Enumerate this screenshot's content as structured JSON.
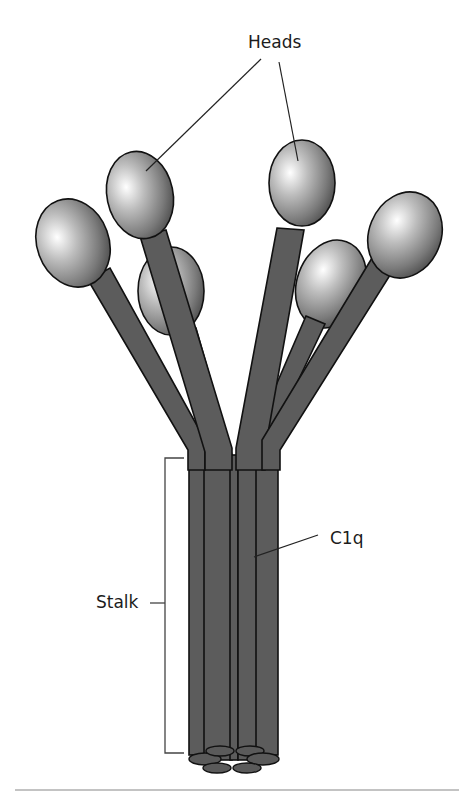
{
  "diagram": {
    "labels": {
      "heads": "Heads",
      "c1q": "C1q",
      "stalk": "Stalk"
    },
    "colors": {
      "stalk_fill": "#5c5c5c",
      "head_highlight": "#ffffff",
      "head_shadow": "#4a4a4a",
      "outline": "#111111",
      "background": "#ffffff"
    },
    "components": {
      "head_count": 6,
      "stalk_strand_count": 6
    }
  }
}
